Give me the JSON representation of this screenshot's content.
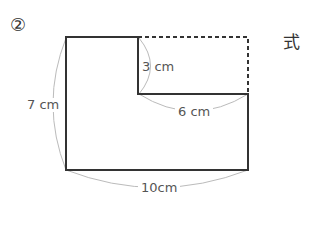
{
  "problem_number": "②",
  "formula_label": "式",
  "diagram": {
    "type": "L-shaped figure (rectangle with top-right corner removed)",
    "labels": {
      "height": "7 cm",
      "notch_height": "3 cm",
      "notch_width": "6 cm",
      "width": "10cm"
    },
    "colors": {
      "outline": "#333333",
      "dimension_arc": "#bbbbbb",
      "text": "#555555"
    }
  }
}
